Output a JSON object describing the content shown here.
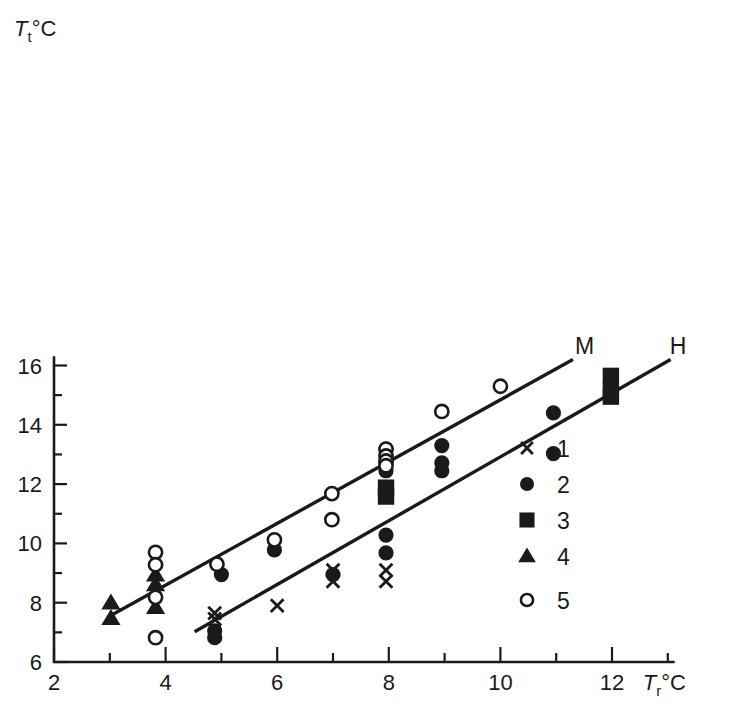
{
  "chart_data": {
    "type": "scatter",
    "title": "",
    "xlabel": "T_r °C",
    "ylabel": "T_t °C",
    "xlabel_main": "T",
    "xlabel_sub": "r",
    "xlabel_unit": "°C",
    "ylabel_main": "T",
    "ylabel_sub": "t",
    "ylabel_unit": "°C",
    "xlim": [
      2,
      13.1
    ],
    "ylim": [
      6,
      16.35
    ],
    "grid": false,
    "legend_position": "inside-right",
    "x_major_ticks": [
      2,
      4,
      6,
      8,
      10,
      12
    ],
    "x_major_labels": [
      "2",
      "4",
      "6",
      "8",
      "10",
      "12"
    ],
    "x_minor_ticks": [
      3,
      5,
      7,
      9,
      11,
      13
    ],
    "y_major_ticks": [
      6,
      8,
      10,
      12,
      14,
      16
    ],
    "y_major_labels": [
      "6",
      "8",
      "10",
      "12",
      "14",
      "16"
    ],
    "y_minor_ticks": [
      7,
      9,
      11,
      13,
      15
    ],
    "legend": [
      {
        "key": "1",
        "marker": "cross",
        "label": "1"
      },
      {
        "key": "2",
        "marker": "circle",
        "label": "2"
      },
      {
        "key": "3",
        "marker": "square",
        "label": "3"
      },
      {
        "key": "4",
        "marker": "triangle",
        "label": "4"
      },
      {
        "key": "5",
        "marker": "open",
        "label": "5"
      }
    ],
    "trend_lines": [
      {
        "name": "M",
        "label": "M",
        "x1": 3.05,
        "y1": 7.6,
        "x2": 11.3,
        "y2": 16.2,
        "label_x": 11.3,
        "label_y": 16.32
      },
      {
        "name": "H",
        "label": "H",
        "x1": 4.52,
        "y1": 7.02,
        "x2": 13.05,
        "y2": 16.2,
        "label_x": 13.0,
        "label_y": 16.32
      }
    ],
    "series": [
      {
        "name": "1",
        "marker": "cross",
        "points": [
          [
            4.88,
            7.65
          ],
          [
            4.88,
            7.45
          ],
          [
            6.0,
            7.9
          ],
          [
            7.0,
            9.1
          ],
          [
            7.0,
            8.72
          ],
          [
            7.95,
            9.1
          ],
          [
            7.95,
            8.72
          ]
        ]
      },
      {
        "name": "2",
        "marker": "circle",
        "points": [
          [
            4.88,
            7.05
          ],
          [
            4.88,
            6.82
          ],
          [
            5.0,
            8.95
          ],
          [
            5.95,
            9.78
          ],
          [
            7.0,
            8.95
          ],
          [
            7.95,
            10.28
          ],
          [
            7.95,
            9.68
          ],
          [
            7.95,
            12.72
          ],
          [
            7.95,
            12.45
          ],
          [
            7.95,
            13.18
          ],
          [
            8.95,
            12.72
          ],
          [
            8.95,
            12.45
          ],
          [
            10.95,
            14.4
          ],
          [
            10.95,
            13.03
          ],
          [
            8.95,
            13.3
          ],
          [
            11.98,
            14.98
          ]
        ]
      },
      {
        "name": "3",
        "marker": "square",
        "points": [
          [
            7.95,
            11.88
          ],
          [
            7.95,
            11.58
          ],
          [
            11.98,
            15.65
          ],
          [
            11.98,
            15.18
          ],
          [
            11.98,
            14.95
          ]
        ]
      },
      {
        "name": "4",
        "marker": "triangle",
        "points": [
          [
            3.02,
            8.0
          ],
          [
            3.02,
            7.48
          ],
          [
            3.82,
            8.95
          ],
          [
            3.82,
            8.62
          ],
          [
            3.82,
            7.85
          ]
        ]
      },
      {
        "name": "5",
        "marker": "open",
        "points": [
          [
            3.82,
            9.7
          ],
          [
            3.82,
            9.28
          ],
          [
            3.82,
            8.18
          ],
          [
            3.82,
            6.82
          ],
          [
            4.92,
            9.3
          ],
          [
            5.95,
            10.12
          ],
          [
            6.98,
            10.8
          ],
          [
            6.98,
            11.68
          ],
          [
            7.95,
            13.18
          ],
          [
            7.95,
            12.95
          ],
          [
            7.95,
            12.78
          ],
          [
            7.95,
            12.62
          ],
          [
            8.95,
            14.45
          ],
          [
            10.0,
            15.3
          ]
        ]
      }
    ]
  }
}
